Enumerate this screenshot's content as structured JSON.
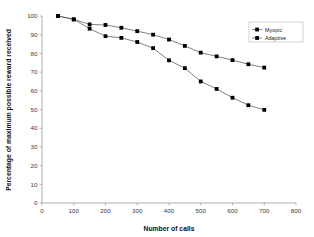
{
  "chart_data": {
    "type": "line",
    "title": "",
    "xlabel": "Number of calls",
    "ylabel": "Percentage of maximum possible reward received",
    "xlim": [
      0,
      800
    ],
    "ylim": [
      0,
      100
    ],
    "xticks": [
      0,
      100,
      200,
      300,
      400,
      500,
      600,
      700,
      800
    ],
    "yticks": [
      0,
      10,
      20,
      30,
      40,
      50,
      60,
      70,
      80,
      90,
      100
    ],
    "grid": false,
    "legend_position": "top-right",
    "x": [
      50,
      100,
      150,
      200,
      250,
      300,
      350,
      400,
      450,
      500,
      550,
      600,
      650,
      700
    ],
    "series": [
      {
        "name": "Myopic",
        "marker": "square",
        "color": "#000000",
        "values": [
          100,
          98.2,
          93.2,
          89.2,
          88.3,
          86.1,
          82.8,
          76.3,
          72.1,
          65.0,
          61.0,
          56.3,
          52.3,
          49.8
        ]
      },
      {
        "name": "Adaptive",
        "marker": "square",
        "color": "#000000",
        "values": [
          100,
          98.2,
          95.5,
          95.2,
          93.7,
          91.9,
          90.0,
          87.4,
          84.0,
          80.4,
          78.4,
          76.4,
          74.2,
          72.4
        ]
      }
    ]
  },
  "legend": {
    "items": [
      {
        "label": "Myopic"
      },
      {
        "label": "Adaptive"
      }
    ]
  },
  "axes": {
    "x_title": "Number of calls",
    "y_title": "Percentage of maximum possible reward received",
    "x_tick_labels": [
      "0",
      "100",
      "200",
      "300",
      "400",
      "500",
      "600",
      "700",
      "800"
    ],
    "y_tick_labels": [
      "0",
      "10",
      "20",
      "30",
      "40",
      "50",
      "60",
      "70",
      "80",
      "90",
      "100"
    ]
  },
  "colors": {
    "axis": "#9a9a9a",
    "line": "#4a4a4a",
    "marker": "#000000",
    "text": "#222222",
    "background": "#ffffff"
  }
}
